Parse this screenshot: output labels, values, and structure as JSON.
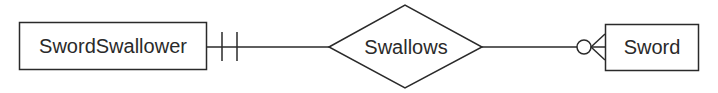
{
  "diagram": {
    "type": "entity-relationship",
    "notation": "crows-foot",
    "entities": [
      {
        "id": "sword_swallower",
        "label": "SwordSwallower"
      },
      {
        "id": "sword",
        "label": "Sword"
      }
    ],
    "relationships": [
      {
        "label": "Swallows",
        "from": "sword_swallower",
        "to": "sword",
        "from_cardinality": "one-and-only-one",
        "to_cardinality": "zero-or-many"
      }
    ],
    "colors": {
      "stroke": "#2a2a2a",
      "background": "#ffffff"
    }
  }
}
